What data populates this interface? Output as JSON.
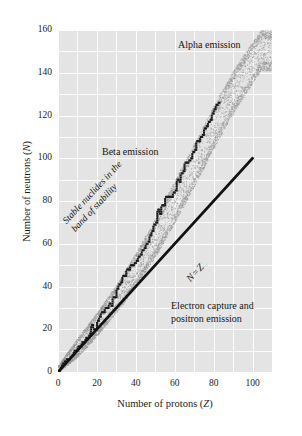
{
  "chart_data": {
    "type": "scatter",
    "title": "",
    "xlabel": "Number of protons (Z)",
    "ylabel": "Number of neutrons (N)",
    "xlim": [
      0,
      110
    ],
    "ylim": [
      0,
      160
    ],
    "xticks": [
      0,
      20,
      40,
      60,
      80,
      100
    ],
    "yticks": [
      0,
      20,
      40,
      60,
      80,
      100,
      120,
      140,
      160
    ],
    "xtick_labels": [
      "0",
      "20",
      "40",
      "60",
      "80",
      "100"
    ],
    "ytick_labels": [
      "0",
      "20",
      "40",
      "60",
      "80",
      "100",
      "120",
      "140",
      "160"
    ],
    "grid": true,
    "grid_minor_step": 10,
    "legend": "none",
    "plot_bg_color": "#e4e4e4",
    "grid_color": "#ffffff",
    "series": [
      {
        "name": "N = Z reference line",
        "type": "line",
        "style": "solid-thick-black",
        "color": "#111111",
        "x": [
          0,
          100
        ],
        "y": [
          0,
          100
        ]
      },
      {
        "name": "Stable nuclides (band of stability)",
        "type": "staircase-markers",
        "color": "#1a1a1a",
        "x": [
          1,
          2,
          3,
          4,
          5,
          6,
          7,
          8,
          9,
          10,
          11,
          12,
          13,
          14,
          15,
          16,
          17,
          18,
          19,
          20,
          21,
          22,
          23,
          24,
          25,
          26,
          27,
          28,
          29,
          30,
          31,
          32,
          33,
          34,
          35,
          36,
          37,
          38,
          39,
          40,
          41,
          42,
          43,
          44,
          45,
          46,
          47,
          48,
          49,
          50,
          51,
          52,
          53,
          54,
          55,
          56,
          57,
          58,
          59,
          60,
          61,
          62,
          63,
          64,
          65,
          66,
          67,
          68,
          69,
          70,
          71,
          72,
          73,
          74,
          75,
          76,
          77,
          78,
          79,
          80,
          81,
          82,
          83
        ],
        "y": [
          0,
          2,
          4,
          5,
          6,
          6,
          7,
          8,
          10,
          10,
          12,
          12,
          14,
          14,
          16,
          16,
          18,
          22,
          20,
          20,
          24,
          26,
          28,
          28,
          30,
          30,
          32,
          31,
          35,
          35,
          39,
          41,
          42,
          45,
          45,
          48,
          48,
          50,
          50,
          51,
          52,
          54,
          55,
          57,
          58,
          60,
          61,
          64,
          66,
          69,
          70,
          76,
          74,
          78,
          78,
          82,
          82,
          82,
          82,
          84,
          85,
          90,
          89,
          93,
          94,
          98,
          98,
          99,
          100,
          103,
          104,
          108,
          108,
          110,
          111,
          114,
          115,
          117,
          118,
          121,
          123,
          125,
          126
        ]
      },
      {
        "name": "Band of stability stipple envelope",
        "type": "stipple-band",
        "color": "#9a9a9a",
        "lower_x": [
          0,
          10,
          20,
          30,
          40,
          50,
          60,
          70,
          83,
          92,
          104
        ],
        "lower_y": [
          0,
          7,
          17,
          28,
          40,
          54,
          70,
          87,
          110,
          124,
          141
        ],
        "upper_x": [
          0,
          10,
          20,
          30,
          40,
          50,
          60,
          70,
          83,
          92,
          104
        ],
        "upper_y": [
          3,
          16,
          28,
          41,
          56,
          72,
          90,
          107,
          130,
          144,
          160
        ]
      }
    ],
    "annotations": [
      {
        "id": "alpha",
        "text": "Alpha emission",
        "x": 70,
        "y": 152,
        "rotation": 0
      },
      {
        "id": "beta",
        "text": "Beta emission",
        "x": 24,
        "y": 102,
        "rotation": 0
      },
      {
        "id": "capture_line1",
        "text": "Electron capture and",
        "x": 58,
        "y": 33,
        "rotation": 0
      },
      {
        "id": "capture_line2",
        "text": "positron emission",
        "x": 58,
        "y": 27,
        "rotation": 0
      },
      {
        "id": "band_line1",
        "text": "Stable nuclides in the",
        "x": 14,
        "y": 60,
        "rotation": 47
      },
      {
        "id": "band_line2",
        "text": "band of stability",
        "x": 14,
        "y": 54,
        "rotation": 47
      },
      {
        "id": "nz",
        "text": "N = Z",
        "x": 62,
        "y": 53,
        "rotation": 47
      }
    ]
  },
  "axes": {
    "x_title_main": "Number of protons (",
    "x_title_symbol": "Z",
    "x_title_close": ")",
    "y_title_main": "Number of neutrons (",
    "y_title_symbol": "N",
    "y_title_close": ")"
  },
  "labels": {
    "alpha_emission": "Alpha emission",
    "beta_emission": "Beta emission",
    "electron_capture_line1": "Electron capture and",
    "electron_capture_line2": "positron emission",
    "band_line1": "Stable nuclides in the",
    "band_line2": "band of stability",
    "nz_symbol_n": "N",
    "nz_equals": "=",
    "nz_symbol_z": "Z"
  }
}
